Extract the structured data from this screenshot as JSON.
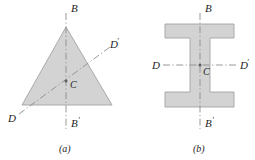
{
  "figure": {
    "background_color": "#ffffff",
    "shape_fill_color": "#d2d2d2",
    "shape_stroke_color": "#9a9a9a",
    "axis_color": "#8d8d8d",
    "label_color": "#1d1d1d",
    "panels": [
      {
        "id": "panel-a",
        "caption": "(a)",
        "shape_name": "triangle",
        "centroid_label": "C",
        "axes": [
          {
            "name": "vertical-axis",
            "start_label": "B",
            "end_label": "B'",
            "style": "dash-dot",
            "orientation": "vertical"
          },
          {
            "name": "inclined-axis",
            "start_label": "D",
            "end_label": "D'",
            "style": "dash-dot",
            "orientation": "inclined"
          }
        ]
      },
      {
        "id": "panel-b",
        "caption": "(b)",
        "shape_name": "i-beam",
        "centroid_label": "C",
        "axes": [
          {
            "name": "vertical-axis",
            "start_label": "B",
            "end_label": "B'",
            "style": "dash-dot",
            "orientation": "vertical"
          },
          {
            "name": "horizontal-axis",
            "start_label": "D",
            "end_label": "D'",
            "style": "dash-dot",
            "orientation": "horizontal"
          }
        ]
      }
    ],
    "labels": {
      "a_B": "B",
      "a_Bprime": "B",
      "a_Bprime_mark": "′",
      "a_D": "D",
      "a_Dprime": "D",
      "a_Dprime_mark": "′",
      "a_C": "C",
      "a_caption": "(a)",
      "b_B": "B",
      "b_Bprime": "B",
      "b_Bprime_mark": "′",
      "b_D": "D",
      "b_Dprime": "D",
      "b_Dprime_mark": "′",
      "b_C": "C",
      "b_caption": "(b)"
    }
  }
}
